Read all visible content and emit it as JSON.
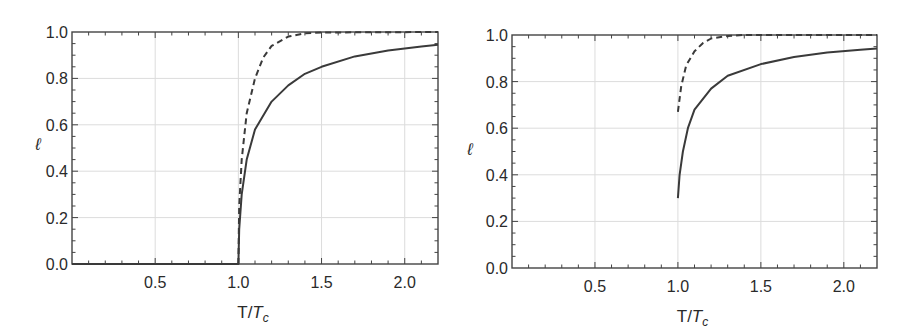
{
  "chart_data": [
    {
      "type": "line",
      "title": "",
      "xlabel": "T/T_c",
      "xlabel_main": "T/",
      "xlabel_italic": "T",
      "xlabel_sub": "c",
      "ylabel": "ℓ",
      "xlim": [
        0,
        2.2
      ],
      "ylim": [
        0,
        1.0
      ],
      "xticks": [
        "0.5",
        "1.0",
        "1.5",
        "2.0"
      ],
      "xtick_values": [
        0.5,
        1.0,
        1.5,
        2.0
      ],
      "yticks": [
        "0.0",
        "0.2",
        "0.4",
        "0.6",
        "0.8",
        "1.0"
      ],
      "ytick_values": [
        0,
        0.2,
        0.4,
        0.6,
        0.8,
        1.0
      ],
      "grid": true,
      "legend": null,
      "series": [
        {
          "name": "solid",
          "style": "solid",
          "x": [
            0,
            1.0,
            1.005,
            1.02,
            1.05,
            1.1,
            1.2,
            1.3,
            1.4,
            1.5,
            1.7,
            1.9,
            2.1,
            2.2
          ],
          "values": [
            0,
            0,
            0.15,
            0.3,
            0.45,
            0.58,
            0.7,
            0.77,
            0.82,
            0.85,
            0.895,
            0.92,
            0.937,
            0.945
          ]
        },
        {
          "name": "dashed",
          "style": "dashed",
          "x": [
            1.0,
            1.005,
            1.02,
            1.05,
            1.1,
            1.15,
            1.2,
            1.3,
            1.4,
            1.5,
            2.2
          ],
          "values": [
            0,
            0.25,
            0.45,
            0.65,
            0.8,
            0.89,
            0.94,
            0.98,
            0.995,
            0.998,
            1.0
          ]
        }
      ]
    },
    {
      "type": "line",
      "title": "",
      "xlabel": "T/T_c",
      "xlabel_main": "T/",
      "xlabel_italic": "T",
      "xlabel_sub": "c",
      "ylabel": "ℓ",
      "xlim": [
        0,
        2.2
      ],
      "ylim": [
        0,
        1.0
      ],
      "xticks": [
        "0.5",
        "1.0",
        "1.5",
        "2.0"
      ],
      "xtick_values": [
        0.5,
        1.0,
        1.5,
        2.0
      ],
      "yticks": [
        "0.0",
        "0.2",
        "0.4",
        "0.6",
        "0.8",
        "1.0"
      ],
      "ytick_values": [
        0,
        0.2,
        0.4,
        0.6,
        0.8,
        1.0
      ],
      "grid": true,
      "legend": null,
      "series": [
        {
          "name": "solid",
          "style": "solid",
          "x": [
            1.0,
            1.01,
            1.03,
            1.06,
            1.1,
            1.2,
            1.3,
            1.5,
            1.7,
            1.9,
            2.1,
            2.2
          ],
          "values": [
            0.3,
            0.4,
            0.5,
            0.6,
            0.68,
            0.77,
            0.825,
            0.875,
            0.905,
            0.925,
            0.937,
            0.942
          ]
        },
        {
          "name": "dashed",
          "style": "dashed",
          "x": [
            1.0,
            1.02,
            1.05,
            1.1,
            1.15,
            1.2,
            1.3,
            1.4,
            2.2
          ],
          "values": [
            0.67,
            0.78,
            0.87,
            0.93,
            0.965,
            0.985,
            0.996,
            1.0,
            1.0
          ]
        }
      ]
    }
  ],
  "colors": {
    "line": "#3a3a3a",
    "grid": "#dcdcdc",
    "frame": "#444444"
  }
}
